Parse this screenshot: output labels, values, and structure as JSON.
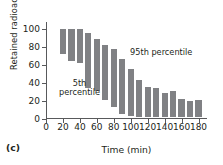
{
  "panel": {
    "label": "(c)"
  },
  "chart_data": {
    "type": "bar",
    "bar_style": "floating-range",
    "title": "",
    "xlabel": "Time (min)",
    "ylabel": "Retained radioactivity (%)",
    "xlim": [
      0,
      190
    ],
    "ylim": [
      0,
      108
    ],
    "xticks": [
      0,
      20,
      40,
      60,
      80,
      100,
      120,
      140,
      160,
      180
    ],
    "yticks": [
      0,
      20,
      40,
      60,
      80,
      100
    ],
    "grid": false,
    "legend": "none",
    "bar_color": "#808184",
    "axis_color": "#58595b",
    "x": [
      20,
      30,
      40,
      50,
      60,
      70,
      80,
      90,
      100,
      110,
      120,
      130,
      140,
      150,
      160,
      170,
      180
    ],
    "series": [
      {
        "name": "5th percentile",
        "values": [
          72,
          65,
          62,
          35,
          31,
          21,
          13,
          5,
          3,
          2,
          2,
          2,
          2,
          2,
          2,
          2,
          2
        ]
      },
      {
        "name": "95th percentile",
        "values": [
          100,
          100,
          100,
          96,
          89,
          82,
          78,
          67,
          56,
          43,
          36,
          34,
          29,
          31,
          22,
          20,
          21
        ]
      }
    ],
    "annotations": [
      {
        "text": "95th percentile",
        "x": 95,
        "y": 78
      },
      {
        "text": "5th\npercentile",
        "x": 38,
        "y": 42
      }
    ]
  }
}
